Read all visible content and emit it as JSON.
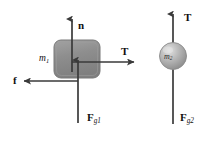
{
  "figure": {
    "background_color": "#ffffff",
    "stroke_color": "#3a3a3a",
    "block_fill": "#8f8f8f",
    "block_edge": "#6e6e6e",
    "ball_fill": "#b0b0b0",
    "ball_highlight": "#d8d8d8"
  },
  "left_system": {
    "body_label_main": "m",
    "body_label_sub": "1",
    "forces": {
      "normal": {
        "symbol": "n",
        "direction": "up"
      },
      "tension": {
        "symbol": "T",
        "direction": "right"
      },
      "friction": {
        "symbol": "f",
        "direction": "left"
      },
      "gravity": {
        "symbol": "F",
        "sub": "g1",
        "direction": "down"
      }
    }
  },
  "right_system": {
    "body_label_main": "m",
    "body_label_sub": "2",
    "forces": {
      "tension": {
        "symbol": "T",
        "direction": "up"
      },
      "gravity": {
        "symbol": "F",
        "sub": "g2",
        "direction": "down"
      }
    }
  }
}
